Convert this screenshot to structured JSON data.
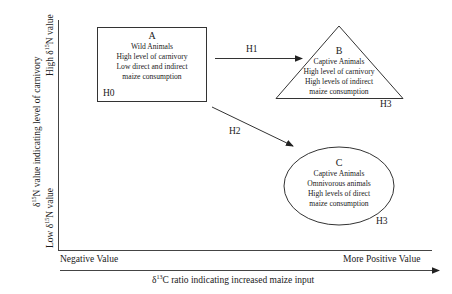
{
  "diagram": {
    "y_axis": {
      "label_prefix": "δ",
      "label_sup": "15",
      "label_suffix": "N value indicating level of carnivory",
      "high": {
        "prefix": "High δ",
        "sup": "15",
        "suffix": "N value"
      },
      "low": {
        "prefix": "Low δ",
        "sup": "15",
        "suffix": "N value"
      }
    },
    "x_axis": {
      "left": "Negative Value",
      "right": "More Positive Value",
      "label_prefix": "δ",
      "label_sup": "13",
      "label_suffix": "C ratio indicating increased maize input"
    },
    "nodes": {
      "a": {
        "letter": "A",
        "shape": "rectangle",
        "lines": [
          "Wild Animals",
          "High level of carnivory",
          "Low direct and indirect",
          "maize consumption"
        ],
        "tag": "H0"
      },
      "b": {
        "letter": "B",
        "shape": "triangle",
        "lines": [
          "Captive Animals",
          "High level of carnivory",
          "High levels of indirect",
          "maize consumption"
        ],
        "tag": "H3"
      },
      "c": {
        "letter": "C",
        "shape": "ellipse",
        "lines": [
          "Captive Animals",
          "Omnivorous animals",
          "High levels of direct",
          "maize consumption"
        ],
        "tag": "H3"
      }
    },
    "edges": [
      {
        "from": "A",
        "to": "B",
        "label": "H1"
      },
      {
        "from": "A",
        "to": "C",
        "label": "H2"
      }
    ],
    "colors": {
      "line": "#333333",
      "text": "#1a1a1a",
      "background": "#ffffff"
    }
  }
}
